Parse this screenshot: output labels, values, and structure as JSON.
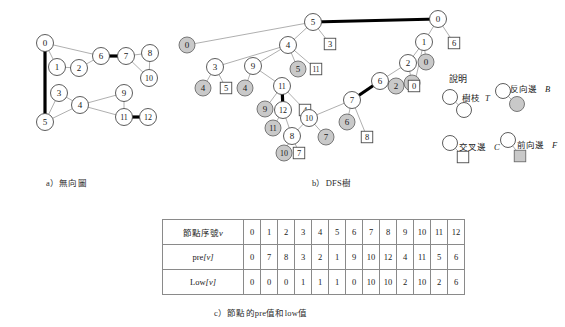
{
  "figure": {
    "captions": {
      "a": "a）無向圖",
      "b": "b）DFS樹",
      "c": "c）節點的pre值和low值"
    },
    "legend": {
      "title": "說明",
      "tree_edge": "樹枝 T",
      "back_edge": "反向邊 B",
      "cross_edge": "交叉邊 C",
      "forward_edge": "前向邊 F"
    },
    "colors": {
      "node_fill": "#ffffff",
      "node_stroke": "#4a4a4a",
      "gray_fill": "#c9c9c9",
      "gray_stroke": "#6b6b6b",
      "edge": "#9a9a9a",
      "heavy_edge": "#000000",
      "text": "#1a1a1a",
      "table_border": "#8a8a8a"
    }
  },
  "undirected_graph": {
    "title": "a）無向圖",
    "nodes": [
      {
        "id": "0",
        "x": 45,
        "y": 43
      },
      {
        "id": "1",
        "x": 57,
        "y": 67
      },
      {
        "id": "2",
        "x": 79,
        "y": 68
      },
      {
        "id": "6",
        "x": 101,
        "y": 56
      },
      {
        "id": "7",
        "x": 126,
        "y": 56
      },
      {
        "id": "8",
        "x": 150,
        "y": 53
      },
      {
        "id": "10",
        "x": 149,
        "y": 78
      },
      {
        "id": "3",
        "x": 59,
        "y": 93
      },
      {
        "id": "4",
        "x": 80,
        "y": 105
      },
      {
        "id": "5",
        "x": 45,
        "y": 122
      },
      {
        "id": "9",
        "x": 124,
        "y": 93
      },
      {
        "id": "11",
        "x": 124,
        "y": 117
      },
      {
        "id": "12",
        "x": 148,
        "y": 117
      }
    ],
    "edges": [
      {
        "a": "0",
        "b": "1",
        "heavy": false
      },
      {
        "a": "0",
        "b": "6",
        "heavy": false
      },
      {
        "a": "0",
        "b": "5",
        "heavy": true
      },
      {
        "a": "1",
        "b": "2",
        "heavy": false
      },
      {
        "a": "2",
        "b": "6",
        "heavy": false
      },
      {
        "a": "6",
        "b": "7",
        "heavy": true
      },
      {
        "a": "7",
        "b": "8",
        "heavy": false
      },
      {
        "a": "7",
        "b": "10",
        "heavy": false
      },
      {
        "a": "8",
        "b": "10",
        "heavy": false
      },
      {
        "a": "3",
        "b": "4",
        "heavy": false
      },
      {
        "a": "3",
        "b": "5",
        "heavy": false
      },
      {
        "a": "4",
        "b": "5",
        "heavy": false
      },
      {
        "a": "4",
        "b": "9",
        "heavy": false
      },
      {
        "a": "4",
        "b": "11",
        "heavy": false
      },
      {
        "a": "9",
        "b": "11",
        "heavy": false
      },
      {
        "a": "11",
        "b": "12",
        "heavy": true
      }
    ]
  },
  "dfs_tree": {
    "title": "b）DFS樹",
    "tree_nodes": [
      {
        "id": "0",
        "x": 438,
        "y": 19
      },
      {
        "id": "1",
        "x": 424,
        "y": 42
      },
      {
        "id": "2",
        "x": 408,
        "y": 63
      },
      {
        "id": "6",
        "x": 380,
        "y": 81
      },
      {
        "id": "7",
        "x": 352,
        "y": 100
      },
      {
        "id": "10",
        "x": 309,
        "y": 118
      },
      {
        "id": "8",
        "x": 292,
        "y": 136
      },
      {
        "id": "5",
        "x": 313,
        "y": 22
      },
      {
        "id": "4",
        "x": 288,
        "y": 45
      },
      {
        "id": "3",
        "x": 215,
        "y": 67
      },
      {
        "id": "9",
        "x": 253,
        "y": 66
      },
      {
        "id": "11",
        "x": 282,
        "y": 86
      },
      {
        "id": "12",
        "x": 283,
        "y": 110
      }
    ],
    "gray_nodes": [
      {
        "id": "0",
        "x": 187,
        "y": 45
      },
      {
        "id": "5",
        "x": 298,
        "y": 69
      },
      {
        "id": "4",
        "x": 203,
        "y": 88
      },
      {
        "id": "4",
        "x": 245,
        "y": 88
      },
      {
        "id": "9",
        "x": 265,
        "y": 109
      },
      {
        "id": "11",
        "x": 273,
        "y": 128
      },
      {
        "id": "10",
        "x": 284,
        "y": 153
      },
      {
        "id": "7",
        "x": 326,
        "y": 137
      },
      {
        "id": "6",
        "x": 347,
        "y": 122
      },
      {
        "id": "2",
        "x": 396,
        "y": 86
      },
      {
        "id": "0",
        "x": 426,
        "y": 62
      },
      {
        "id": "1",
        "x": 412,
        "y": 83
      }
    ],
    "square_nodes": [
      {
        "id": "3",
        "x": 330,
        "y": 44
      },
      {
        "id": "11",
        "x": 316,
        "y": 69
      },
      {
        "id": "5",
        "x": 226,
        "y": 88
      },
      {
        "id": "4",
        "x": 305,
        "y": 110
      },
      {
        "id": "7",
        "x": 299,
        "y": 153
      },
      {
        "id": "8",
        "x": 367,
        "y": 137
      },
      {
        "id": "0",
        "x": 414,
        "y": 86
      },
      {
        "id": "6",
        "x": 454,
        "y": 43
      }
    ],
    "tree_edges": [
      {
        "a": "0",
        "b": "1",
        "heavy": false
      },
      {
        "a": "1",
        "b": "2",
        "heavy": false
      },
      {
        "a": "2",
        "b": "6",
        "heavy": false
      },
      {
        "a": "6",
        "b": "7",
        "heavy": true
      },
      {
        "a": "7",
        "b": "10",
        "heavy": false
      },
      {
        "a": "10",
        "b": "8",
        "heavy": false
      },
      {
        "a": "0",
        "b": "5",
        "heavy": true
      },
      {
        "a": "5",
        "b": "4",
        "heavy": false
      },
      {
        "a": "4",
        "b": "3",
        "heavy": false
      },
      {
        "a": "4",
        "b": "9",
        "heavy": false
      },
      {
        "a": "9",
        "b": "11",
        "heavy": false
      },
      {
        "a": "11",
        "b": "12",
        "heavy": true
      },
      {
        "a": "12",
        "b": "8",
        "heavy": false
      }
    ]
  },
  "table": {
    "caption": "c）節點的pre值和low值",
    "rows": [
      {
        "label": "節點序號",
        "label_var": "v",
        "values": [
          "0",
          "1",
          "2",
          "3",
          "4",
          "5",
          "6",
          "7",
          "8",
          "9",
          "10",
          "11",
          "12"
        ]
      },
      {
        "label": "pre",
        "label_var": "[v]",
        "values": [
          "0",
          "7",
          "8",
          "3",
          "2",
          "1",
          "9",
          "10",
          "12",
          "4",
          "11",
          "5",
          "6"
        ]
      },
      {
        "label": "Low",
        "label_var": "[v]",
        "values": [
          "0",
          "0",
          "0",
          "1",
          "1",
          "1",
          "0",
          "10",
          "10",
          "2",
          "10",
          "2",
          "6"
        ]
      }
    ]
  }
}
